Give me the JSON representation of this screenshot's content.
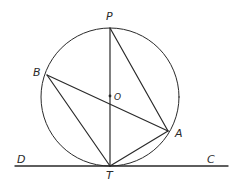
{
  "diagram": {
    "colors": {
      "background": "#ffffff",
      "ink": "#2a2a2a"
    },
    "circle": {
      "center": [
        110,
        97
      ],
      "radius": 69,
      "center_label": "O"
    },
    "points": {
      "P": {
        "label": "P",
        "x": 110,
        "y": 28,
        "label_x": 106,
        "label_y": 20
      },
      "B": {
        "label": "B",
        "x": 47,
        "y": 75,
        "label_x": 33,
        "label_y": 76
      },
      "O": {
        "label": "O",
        "x": 110,
        "y": 96,
        "label_x": 114,
        "label_y": 100
      },
      "A": {
        "label": "A",
        "x": 168,
        "y": 131,
        "label_x": 175,
        "label_y": 137
      },
      "T": {
        "label": "T",
        "x": 110,
        "y": 166,
        "label_x": 106,
        "label_y": 179
      },
      "D": {
        "label": "D",
        "x": 15,
        "y": 166,
        "label_x": 17,
        "label_y": 163
      },
      "C": {
        "label": "C",
        "x": 228,
        "y": 166,
        "label_x": 207,
        "label_y": 163
      }
    },
    "segments": [
      {
        "from": "P",
        "to": "T",
        "name": "diameter PT"
      },
      {
        "from": "P",
        "to": "A",
        "name": "chord PA"
      },
      {
        "from": "B",
        "to": "A",
        "name": "chord BA"
      },
      {
        "from": "B",
        "to": "T",
        "name": "chord BT"
      },
      {
        "from": "A",
        "to": "T",
        "name": "chord AT"
      },
      {
        "from": "D",
        "to": "C",
        "name": "tangent DC"
      }
    ]
  }
}
